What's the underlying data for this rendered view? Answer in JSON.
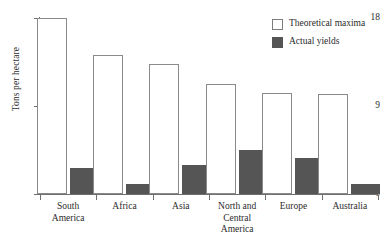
{
  "chart_data": {
    "type": "bar",
    "title": "",
    "xlabel": "",
    "ylabel": "Tons per hectare",
    "ylim": [
      0,
      18
    ],
    "yticks": [
      "0",
      "9",
      "18"
    ],
    "ytick_values": [
      0,
      9,
      18
    ],
    "grid": false,
    "legend_position": "top-right",
    "categories": [
      "South America",
      "Africa",
      "Asia",
      "North and Central America",
      "Europe",
      "Australia"
    ],
    "category_lines": [
      [
        "South",
        "America"
      ],
      [
        "Africa"
      ],
      [
        "Asia"
      ],
      [
        "North and",
        "Central",
        "America"
      ],
      [
        "Europe"
      ],
      [
        "Australia"
      ]
    ],
    "series": [
      {
        "name": "Theoretical maxima",
        "color": "#ffffff",
        "edge_color": "#8a8a8a",
        "values": [
          18.0,
          14.2,
          13.3,
          11.3,
          10.3,
          10.2
        ]
      },
      {
        "name": "Actual yields",
        "color": "#555555",
        "edge_color": "#555555",
        "values": [
          2.7,
          1.0,
          3.0,
          4.5,
          3.7,
          1.0
        ]
      }
    ]
  },
  "legend": {
    "items": [
      {
        "label": "Theoretical maxima",
        "swatch": "theoretical"
      },
      {
        "label": "Actual yields",
        "swatch": "actual"
      }
    ]
  },
  "axes": {
    "y_title": "Tons per hectare"
  }
}
